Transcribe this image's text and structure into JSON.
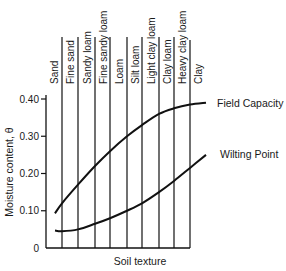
{
  "chart_data": {
    "type": "line",
    "title": "",
    "xlabel": "Soil texture",
    "ylabel": "Moisture content, θ",
    "ylim": [
      0,
      0.45
    ],
    "yticks": [
      0,
      0.1,
      0.2,
      0.3,
      0.4
    ],
    "ytick_labels": [
      "0",
      "0.10",
      "0.20",
      "0.30",
      "0.40"
    ],
    "grid": "vertical lines separating soil texture classes",
    "legend": "inline labels at right end of each curve",
    "categories": [
      "Sand",
      "Fine sand",
      "Sandy loam",
      "Fine sandy loam",
      "Loam",
      "Silt loam",
      "Light clay loam",
      "Clay loam",
      "Heavy clay loam",
      "Clay"
    ],
    "series": [
      {
        "name": "Field Capacity",
        "values": [
          0.12,
          0.17,
          0.22,
          0.26,
          0.3,
          0.33,
          0.36,
          0.375,
          0.385,
          0.39
        ]
      },
      {
        "name": "Wilting Point",
        "values": [
          0.045,
          0.05,
          0.065,
          0.08,
          0.1,
          0.12,
          0.15,
          0.18,
          0.215,
          0.25
        ]
      }
    ]
  },
  "labels": {
    "ylabel": "Moisture content, θ",
    "xlabel": "Soil texture",
    "field_capacity": "Field Capacity",
    "wilting_point": "Wilting Point"
  },
  "colors": {
    "line": "#111111",
    "text": "#1a1a1a",
    "background": "#ffffff"
  }
}
